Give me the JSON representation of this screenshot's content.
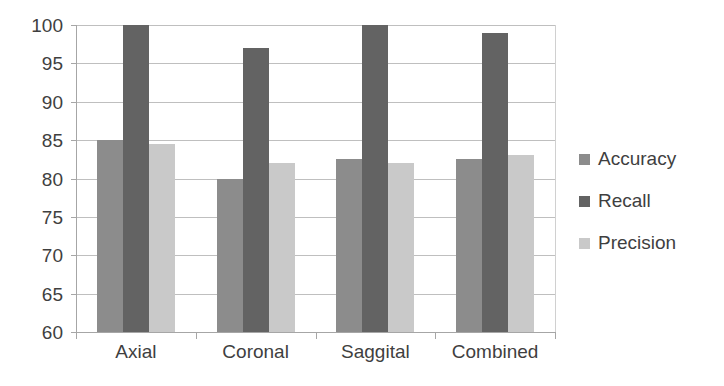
{
  "chart_data": {
    "type": "bar",
    "title": "",
    "subtitle": "",
    "xlabel": "",
    "ylabel": "",
    "ylim": [
      60,
      100
    ],
    "ytick_step": 5,
    "grid": true,
    "legend_position": "right",
    "categories": [
      "Axial",
      "Coronal",
      "Saggital",
      "Combined"
    ],
    "ytick_labels": [
      "100",
      "95",
      "90",
      "85",
      "80",
      "75",
      "70",
      "65",
      "60"
    ],
    "ytick_values": [
      100,
      95,
      90,
      85,
      80,
      75,
      70,
      65,
      60
    ],
    "series": [
      {
        "name": "Accuracy",
        "color": "#8c8c8c",
        "values": [
          85.0,
          80.0,
          82.5,
          82.5
        ]
      },
      {
        "name": "Recall",
        "color": "#636363",
        "values": [
          100.0,
          97.0,
          100.0,
          99.0
        ]
      },
      {
        "name": "Precision",
        "color": "#c9c9c9",
        "values": [
          84.5,
          82.0,
          82.0,
          83.0
        ]
      }
    ]
  },
  "legend": {
    "items": [
      {
        "label": "Accuracy",
        "color": "#8c8c8c"
      },
      {
        "label": "Recall",
        "color": "#636363"
      },
      {
        "label": "Precision",
        "color": "#c9c9c9"
      }
    ]
  },
  "axis": {
    "y_min_label": "60",
    "y_max_label": "100"
  }
}
